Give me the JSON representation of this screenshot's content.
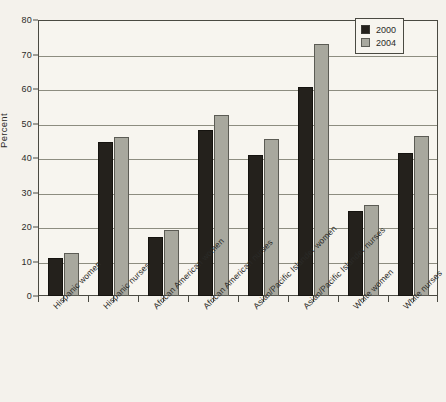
{
  "chart_data": {
    "type": "bar",
    "title": "",
    "xlabel": "",
    "ylabel": "Percent",
    "ylim": [
      0,
      80
    ],
    "yticks": [
      0,
      10,
      20,
      30,
      40,
      50,
      60,
      70,
      80
    ],
    "grid": true,
    "legend_position": "top-right",
    "categories": [
      "Hispanic women",
      "Hispanic nurses",
      "African American women",
      "African American nurses",
      "Asian/Pacific Islander women",
      "Asian/Pacific Islander nurses",
      "White women",
      "White nurses"
    ],
    "series": [
      {
        "name": "2000",
        "color": "#24211c",
        "values": [
          11,
          44.5,
          17,
          48,
          41,
          60.5,
          24.5,
          41.5
        ]
      },
      {
        "name": "2004",
        "color": "#a8a89e",
        "values": [
          12.5,
          46,
          19,
          52.5,
          45.5,
          73,
          26.5,
          46.5
        ]
      }
    ]
  },
  "legend": {
    "entries": [
      {
        "label": "2000"
      },
      {
        "label": "2004"
      }
    ]
  }
}
